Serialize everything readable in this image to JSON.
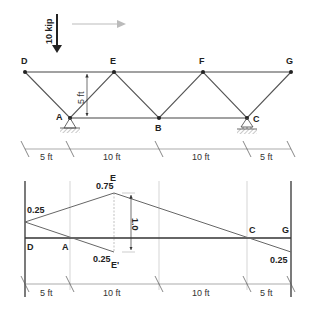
{
  "load": {
    "label": "10 kip",
    "direction_arrow": "right-arrow"
  },
  "truss": {
    "nodes": {
      "D": {
        "label": "D",
        "x": 25,
        "y": 72
      },
      "E": {
        "label": "E",
        "x": 114,
        "y": 72
      },
      "F": {
        "label": "F",
        "x": 203,
        "y": 72
      },
      "G": {
        "label": "G",
        "x": 291,
        "y": 72
      },
      "A": {
        "label": "A",
        "x": 70,
        "y": 118
      },
      "B": {
        "label": "B",
        "x": 159,
        "y": 118
      },
      "C": {
        "label": "C",
        "x": 247,
        "y": 118
      }
    },
    "height_label": "5 ft",
    "supports": [
      "A",
      "C"
    ]
  },
  "top_dimensions": [
    "5 ft",
    "10 ft",
    "10 ft",
    "5 ft"
  ],
  "influence_line": {
    "labels": {
      "D": "D",
      "A": "A",
      "C": "C",
      "G": "G",
      "E": "E",
      "E_prime": "E'"
    },
    "values": {
      "D": "0.25",
      "E": "0.75",
      "E_prime": "0.25",
      "G": "0.25",
      "jump": "1.0"
    }
  },
  "bottom_dimensions": [
    "5 ft",
    "10 ft",
    "10 ft",
    "5 ft"
  ]
}
